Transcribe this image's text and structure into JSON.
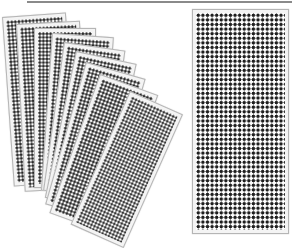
{
  "image": {
    "description": "Product photo: a fanned stack of perforated dotted sheets on the left and a single upright perforated dotted sheet on the right, on a white background",
    "background_color": "#ffffff",
    "dot_color": "#1e1e1e",
    "sheet_border_color": "#b5b5b5"
  },
  "fan_sheets": [
    {
      "left": 2,
      "top": 17,
      "width": 64,
      "height": 170,
      "rotate": -4
    },
    {
      "left": 16,
      "top": 24,
      "width": 64,
      "height": 168,
      "rotate": -3
    },
    {
      "left": 34,
      "top": 28,
      "width": 62,
      "height": 160,
      "rotate": 0
    },
    {
      "left": 52,
      "top": 33,
      "width": 62,
      "height": 158,
      "rotate": 4
    },
    {
      "left": 64,
      "top": 42,
      "width": 62,
      "height": 150,
      "rotate": 8
    },
    {
      "left": 76,
      "top": 51,
      "width": 62,
      "height": 150,
      "rotate": 12
    },
    {
      "left": 86,
      "top": 62,
      "width": 62,
      "height": 148,
      "rotate": 16
    },
    {
      "left": 100,
      "top": 74,
      "width": 62,
      "height": 148,
      "rotate": 20
    }
  ],
  "front_sheet": {
    "left": 130,
    "top": 91,
    "width": 58,
    "height": 146,
    "rotate": 24
  },
  "right_sheet": {
    "left": 192,
    "top": 9,
    "width": 97,
    "height": 225,
    "rotate": 0
  }
}
